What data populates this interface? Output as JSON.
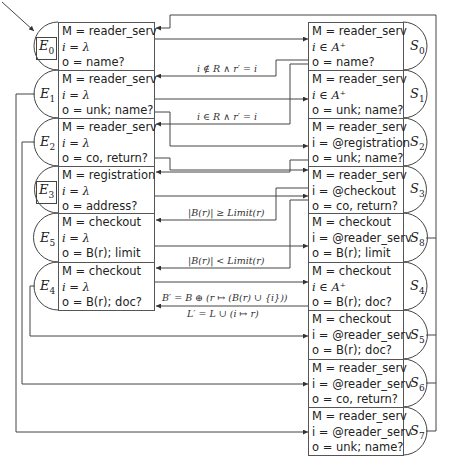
{
  "diagram": {
    "env_states": [
      {
        "id": "E0",
        "label": "E",
        "sub": "0",
        "initial": true,
        "M": "M = reader_serv",
        "i": "i = λ",
        "o": "o = name?"
      },
      {
        "id": "E1",
        "label": "E",
        "sub": "1",
        "initial": false,
        "M": "M = reader_serv",
        "i": "i = λ",
        "o": "o = unk; name?"
      },
      {
        "id": "E2",
        "label": "E",
        "sub": "2",
        "initial": false,
        "M": "M = reader_serv",
        "i": "i = λ",
        "o": "o = co, return?"
      },
      {
        "id": "E3",
        "label": "E",
        "sub": "3",
        "initial": true,
        "M": "M = registration",
        "i": "i = λ",
        "o": "o = address?"
      },
      {
        "id": "E5",
        "label": "E",
        "sub": "5",
        "initial": false,
        "M": "M = checkout",
        "i": "i = λ",
        "o": "o = B(r); limit"
      },
      {
        "id": "E4",
        "label": "E",
        "sub": "4",
        "initial": false,
        "M": "M = checkout",
        "i": "i = λ",
        "o": "o = B(r); doc?"
      }
    ],
    "sys_states": [
      {
        "id": "S0",
        "label": "S",
        "sub": "0",
        "M": "M = reader_serv",
        "i": "i ∈ A⁺",
        "o": "o = name?"
      },
      {
        "id": "S1",
        "label": "S",
        "sub": "1",
        "M": "M = reader_serv",
        "i": "i ∈ A⁺",
        "o": "o = unk; name?"
      },
      {
        "id": "S2",
        "label": "S",
        "sub": "2",
        "M": "M = reader_serv",
        "i": "i = @registration",
        "o": "o = unk; name?"
      },
      {
        "id": "S3",
        "label": "S",
        "sub": "3",
        "M": "M = reader_serv",
        "i": "i = @checkout",
        "o": "o = co, return?"
      },
      {
        "id": "S8",
        "label": "S",
        "sub": "8",
        "M": "M = checkout",
        "i": "i = @reader_serv",
        "o": "o = B(r); limit"
      },
      {
        "id": "S4",
        "label": "S",
        "sub": "4",
        "M": "M = checkout",
        "i": "i ∈ A⁺",
        "o": "o = B(r); doc?"
      },
      {
        "id": "S5",
        "label": "S",
        "sub": "5",
        "M": "M = checkout",
        "i": "i = @reader_serv",
        "o": "o = B(r); doc?"
      },
      {
        "id": "S6",
        "label": "S",
        "sub": "6",
        "M": "M = reader_serv",
        "i": "i = @reader_serv",
        "o": "o = co, return?"
      },
      {
        "id": "S7",
        "label": "S",
        "sub": "7",
        "M": "M = reader_serv",
        "i": "i = @reader_serv",
        "o": "o = unk; name?"
      }
    ],
    "edge_labels": {
      "s0_to_e1": "i ∉ R ∧ r′ = i",
      "s1_to_e2": "i ∈ R ∧ r′ = i",
      "s3_to_e5": "|B(r)| ≥ Limit(r)",
      "s3_to_e4": "|B(r)| < Limit(r)",
      "s4_to_e2_line1": "B′ = B ⊕ (r ↦ (B(r) ∪ {i}))",
      "s4_to_e2_line2": "L′ = L ∪ (i ↦ r)"
    },
    "colors": {
      "line": "#444444",
      "border": "#555555",
      "text": "#222222"
    }
  }
}
